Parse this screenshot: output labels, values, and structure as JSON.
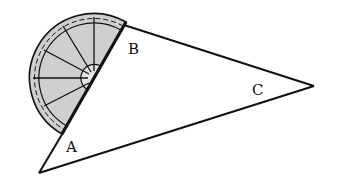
{
  "figure": {
    "labels": {
      "A": "A",
      "B": "B",
      "C": "C"
    },
    "colors": {
      "line": "#111111",
      "protractor_fill": "#cfcfcf",
      "background": "#ffffff"
    }
  }
}
